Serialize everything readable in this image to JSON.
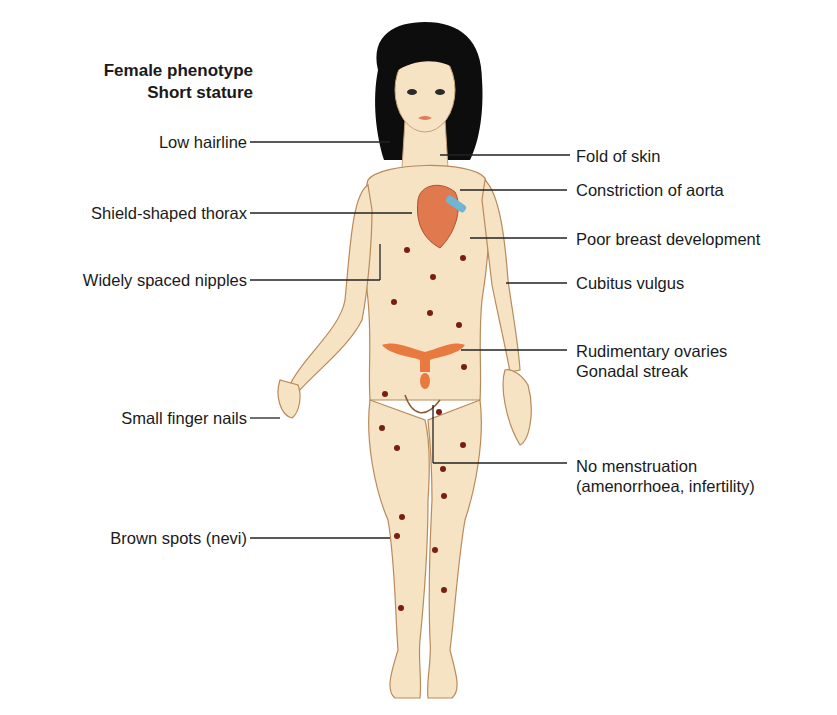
{
  "figure": {
    "title_lines": [
      "Female phenotype",
      "Short stature"
    ],
    "left_labels": [
      {
        "text": "Low hairline"
      },
      {
        "text": "Shield-shaped thorax"
      },
      {
        "text": "Widely spaced nipples"
      },
      {
        "text": "Small finger nails"
      },
      {
        "text": "Brown spots (nevi)"
      }
    ],
    "right_labels": [
      {
        "text": "Fold of skin"
      },
      {
        "text": "Constriction of aorta"
      },
      {
        "text": "Poor breast development"
      },
      {
        "text": "Cubitus vulgus"
      },
      {
        "lines": [
          "Rudimentary ovaries",
          "Gonadal streak"
        ]
      },
      {
        "lines": [
          "No menstruation",
          "(amenorrhoea, infertility)"
        ]
      }
    ],
    "colors": {
      "skin": "#f6e3c4",
      "skin_outline": "#b98a5a",
      "hair": "#0d0d0d",
      "heart": "#e07a4e",
      "aorta": "#6fb5d6",
      "ovary": "#e8793f",
      "nevi": "#7a1f10",
      "leader_line": "#222222"
    }
  }
}
